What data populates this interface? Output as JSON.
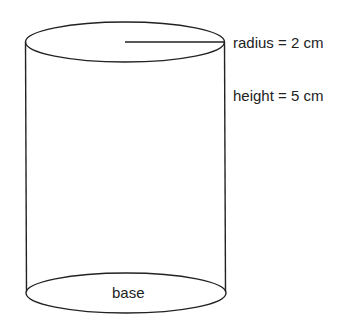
{
  "diagram": {
    "shape": "cylinder",
    "labels": {
      "radius": "radius = 2 cm",
      "height": "height = 5 cm",
      "base": "base"
    },
    "values": {
      "radius_cm": 2,
      "height_cm": 5
    },
    "stroke_color": "#222222"
  }
}
